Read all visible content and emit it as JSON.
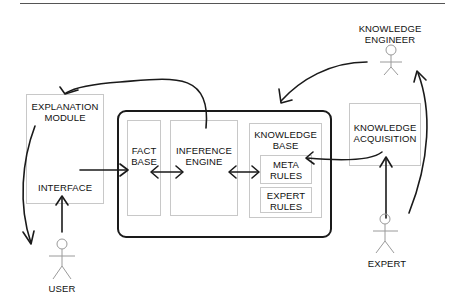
{
  "page": {
    "number": "..."
  },
  "actors": {
    "knowledge_engineer": "KNOWLEDGE\nENGINEER",
    "knowledge_engineer_line1": "KNOWLEDGE",
    "knowledge_engineer_line2": "ENGINEER",
    "user": "USER",
    "expert": "EXPERT"
  },
  "modules": {
    "explanation_line1": "EXPLANATION",
    "explanation_line2": "MODULE",
    "interface": "INTERFACE",
    "fact_base_line1": "FACT",
    "fact_base_line2": "BASE",
    "inference_line1": "INFERENCE",
    "inference_line2": "ENGINE",
    "knowledge_base_line1": "KNOWLEDGE",
    "knowledge_base_line2": "BASE",
    "meta_rules_line1": "META",
    "meta_rules_line2": "RULES",
    "expert_rules_line1": "EXPERT",
    "expert_rules_line2": "RULES",
    "knowledge_acq_line1": "KNOWLEDGE",
    "knowledge_acq_line2": "ACQUISITION"
  },
  "colors": {
    "line": "#1a1a1a",
    "box_border": "#c8c8c8",
    "background": "#ffffff"
  }
}
